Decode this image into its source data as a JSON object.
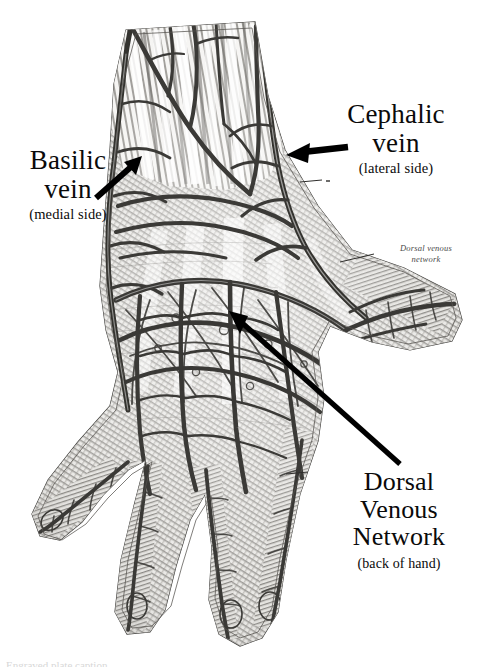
{
  "figure": {
    "background_color": "#ffffff",
    "ink_color": "#4a4a4a",
    "label_color": "#0a0a0a",
    "width": 480,
    "height": 667
  },
  "labels": {
    "cephalic": {
      "line1": "Cephalic",
      "line2": "vein",
      "sub": "(lateral side)"
    },
    "basilic": {
      "line1": "Basilic",
      "line2": "vein",
      "sub": "(medial side)"
    },
    "dorsal_venous_network": {
      "line1": "Dorsal",
      "line2": "Venous",
      "line3": "Network",
      "sub": "(back of hand)"
    }
  },
  "captions": {
    "dorsal_venous_network_plate": {
      "line1": "Dorsal venous",
      "line2": "network"
    }
  },
  "bottom_crop": {
    "text": "Engraved plate caption"
  },
  "arrows": {
    "cephalic_arrow": {
      "from_x": 342,
      "from_y": 148,
      "to_x": 288,
      "to_y": 156
    },
    "basilic_arrow": {
      "from_x": 98,
      "from_y": 196,
      "to_x": 140,
      "to_y": 157
    },
    "dorsal_arrow": {
      "from_x": 398,
      "from_y": 462,
      "to_x": 231,
      "to_y": 312
    }
  },
  "leader_lines": {
    "cephalic_tick": {
      "x1": 300,
      "y1": 182,
      "x2": 322,
      "y2": 180
    },
    "dorsal_caption_leader": {
      "x1": 340,
      "y1": 262,
      "x2": 372,
      "y2": 254
    },
    "finger_tick": {
      "x1": 286,
      "y1": 474,
      "x2": 306,
      "y2": 472
    }
  }
}
